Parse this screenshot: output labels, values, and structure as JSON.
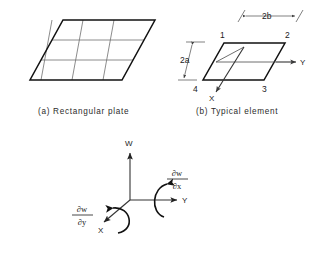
{
  "figure": {
    "background_color": "#ffffff",
    "line_color": "#111111",
    "grid_color": "#6e6e6e"
  },
  "panel_a": {
    "caption": "(a)  Rectangular plate",
    "caption_prefix": "(a)",
    "caption_text": "Rectangular plate",
    "mesh_rows": 3,
    "mesh_cols": 3
  },
  "panel_b": {
    "caption": "(b)  Typical element",
    "caption_prefix": "(b)",
    "caption_text": "Typical element",
    "nodes": [
      {
        "id": "1",
        "label": "1",
        "position": "top-left"
      },
      {
        "id": "2",
        "label": "2",
        "position": "top-right"
      },
      {
        "id": "3",
        "label": "3",
        "position": "bottom-right"
      },
      {
        "id": "4",
        "label": "4",
        "position": "bottom-left"
      }
    ],
    "dimensions": [
      {
        "name": "width",
        "label": "2b",
        "orientation": "horizontal"
      },
      {
        "name": "height",
        "label": "2a",
        "orientation": "vertical"
      }
    ],
    "axes": [
      {
        "name": "y-axis",
        "label": "Y",
        "direction": "right"
      },
      {
        "name": "x-axis",
        "label": "X",
        "direction": "down-left"
      }
    ]
  },
  "panel_c": {
    "axes": [
      {
        "name": "w-axis",
        "label": "W",
        "direction": "up"
      },
      {
        "name": "y-axis",
        "label": "Y",
        "direction": "right"
      },
      {
        "name": "x-axis",
        "label": "X",
        "direction": "down-left"
      }
    ],
    "rotations": [
      {
        "name": "rotation-about-x",
        "numerator": "∂w",
        "denominator": "∂x",
        "about_axis": "Y",
        "side": "right"
      },
      {
        "name": "rotation-about-y",
        "numerator": "∂w",
        "denominator": "∂y",
        "about_axis": "X",
        "side": "left"
      }
    ]
  }
}
